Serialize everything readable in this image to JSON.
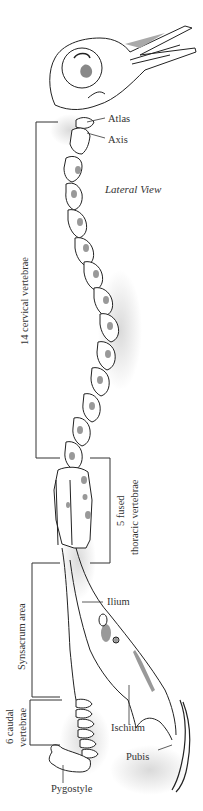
{
  "diagram": {
    "view_label": "Lateral View",
    "labels": {
      "atlas": "Atlas",
      "axis": "Axis",
      "ilium": "Ilium",
      "ischium": "Ischium",
      "pubis": "Pubis",
      "pygostyle": "Pygostyle"
    },
    "brackets": {
      "cervical": "14 cervical vertebrae",
      "thoracic_line1": "5 fused",
      "thoracic_line2": "thoracic vertebrae",
      "synsacrum": "Synsacrum area",
      "caudal_line1": "6 caudal",
      "caudal_line2": "vertebrae"
    },
    "colors": {
      "ink": "#222222",
      "shade": "#9a9a9a",
      "background": "#ffffff"
    }
  }
}
